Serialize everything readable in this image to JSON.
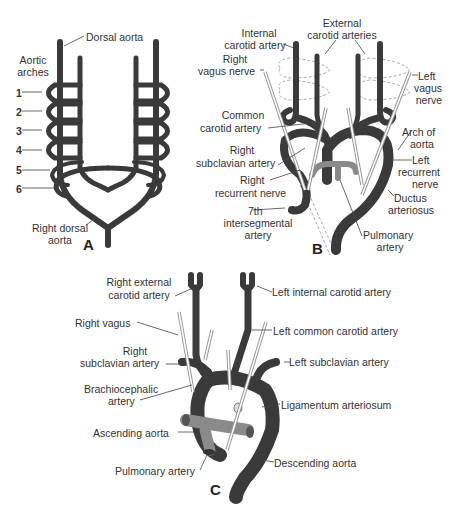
{
  "colors": {
    "artery": "#3a3a3a",
    "pulmonary": "#8a8a8a",
    "nerve": "#999999",
    "text": "#333333",
    "background": "#ffffff"
  },
  "panels": {
    "A": {
      "letter": "A",
      "labels": {
        "dorsal_aorta": "Dorsal aorta",
        "aortic_arches_1": "Aortic",
        "aortic_arches_2": "arches",
        "arch_numbers": [
          "1",
          "2",
          "3",
          "4",
          "5",
          "6"
        ],
        "right_dorsal_aorta_1": "Right dorsal",
        "right_dorsal_aorta_2": "aorta"
      }
    },
    "B": {
      "letter": "B",
      "labels": {
        "internal_carotid_1": "Internal",
        "internal_carotid_2": "carotid artery",
        "external_carotid_1": "External",
        "external_carotid_2": "carotid arteries",
        "right_vagus_1": "Right",
        "right_vagus_2": "vagus nerve",
        "left_vagus_1": "Left",
        "left_vagus_2": "vagus",
        "left_vagus_3": "nerve",
        "common_carotid_1": "Common",
        "common_carotid_2": "carotid artery",
        "arch_of_aorta_1": "Arch of",
        "arch_of_aorta_2": "aorta",
        "right_subclavian_1": "Right",
        "right_subclavian_2": "subclavian artery",
        "left_recurrent_1": "Left",
        "left_recurrent_2": "recurrent",
        "left_recurrent_3": "nerve",
        "right_recurrent_1": "Right",
        "right_recurrent_2": "recurrent nerve",
        "ductus_1": "Ductus",
        "ductus_2": "arteriosus",
        "seventh_1": "7th",
        "seventh_2": "intersegmental",
        "seventh_3": "artery",
        "pulmonary_1": "Pulmonary",
        "pulmonary_2": "artery"
      }
    },
    "C": {
      "letter": "C",
      "labels": {
        "right_external_carotid_1": "Right external",
        "right_external_carotid_2": "carotid artery",
        "left_internal_carotid": "Left internal carotid artery",
        "right_vagus": "Right vagus",
        "left_common_carotid": "Left common carotid artery",
        "right_subclavian_1": "Right",
        "right_subclavian_2": "subclavian artery",
        "left_subclavian": "Left subclavian artery",
        "brachiocephalic_1": "Brachiocephalic",
        "brachiocephalic_2": "artery",
        "ligamentum": "Ligamentum arteriosum",
        "ascending_aorta": "Ascending aorta",
        "pulmonary_artery": "Pulmonary artery",
        "descending_aorta": "Descending aorta"
      }
    }
  }
}
